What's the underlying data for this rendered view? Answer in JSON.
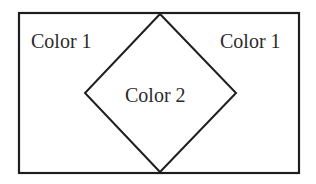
{
  "diagram": {
    "regions": [
      {
        "id": "left-outer",
        "label": "Color 1"
      },
      {
        "id": "right-outer",
        "label": "Color 1"
      },
      {
        "id": "center-diamond",
        "label": "Color 2"
      }
    ],
    "colors": {
      "stroke": "#1e1e1e",
      "background": "#ffffff",
      "text": "#2a2a2a"
    }
  }
}
